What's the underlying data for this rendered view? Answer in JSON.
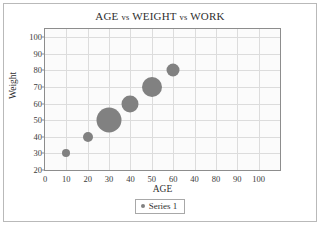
{
  "chart_data": {
    "type": "scatter",
    "title": "AGE vs WEIGHT vs WORK",
    "title_parts": {
      "first": "AGE",
      "vs1": "vs",
      "second": "WEIGHT",
      "vs2": "vs",
      "third": "WORK"
    },
    "xlabel": "AGE",
    "ylabel": "Weight",
    "xlim": [
      0,
      110
    ],
    "ylim": [
      20,
      105
    ],
    "xticks": [
      0,
      10,
      20,
      30,
      40,
      50,
      60,
      70,
      80,
      90,
      100
    ],
    "xtick_labels": [
      "0",
      "10",
      "20",
      "30",
      "40",
      "50",
      "60",
      "40",
      "80",
      "90",
      "100"
    ],
    "yticks": [
      20,
      30,
      40,
      50,
      60,
      70,
      80,
      90,
      100
    ],
    "ytick_labels": [
      "20",
      "30",
      "40",
      "50",
      "60",
      "70",
      "80",
      "90",
      "100"
    ],
    "grid": true,
    "legend_position": "bottom",
    "marker_color": "#818181",
    "series": [
      {
        "name": "Series 1",
        "x": [
          10,
          20,
          30,
          40,
          50,
          60
        ],
        "y": [
          30,
          40,
          50,
          60,
          70,
          80
        ],
        "size": [
          8,
          10,
          25,
          17,
          20,
          13
        ]
      }
    ]
  },
  "legend": {
    "entries": [
      {
        "label": "Series 1",
        "color": "#818181"
      }
    ]
  }
}
